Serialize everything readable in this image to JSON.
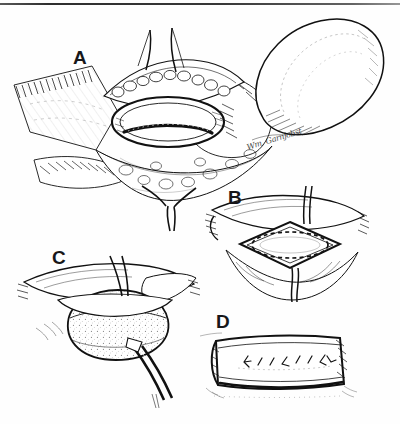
{
  "figure": {
    "medium": "pen-and-ink line drawing",
    "background_color": "#ffffff",
    "ink_color": "#111111",
    "top_rule_color": "#2a2a2a",
    "caption": "",
    "signature": "Wm. Garnjobst"
  },
  "panels": [
    {
      "id": "A",
      "label": "A",
      "title": "Exposed shaft with longitudinal opening",
      "description": "Large overview view: retracted skin flaps held open with stay sutures expose an elliptical opening in the shaft; the rounded glans lies at upper right; a suture tail hangs from the lower apex.",
      "elements": [
        "retracted-flap-left",
        "retracted-flap-right",
        "elliptical-opening",
        "dashed-incision-line",
        "glans",
        "stay-suture-top",
        "stay-suture-bottom",
        "suture-tail"
      ]
    },
    {
      "id": "B",
      "label": "B",
      "title": "Diamond-shaped defect with planned elliptical excision",
      "description": "Close-up of the opened field retracted into a diamond shape; a dashed ellipse marks the planned excision outline; vertical stay sutures run above and below.",
      "elements": [
        "diamond-defect",
        "dashed-ellipse-outline",
        "stay-suture-upper",
        "stay-suture-lower",
        "hatched-tissue-edges"
      ]
    },
    {
      "id": "C",
      "label": "C",
      "title": "Delivery of the mass with forceps",
      "description": "A stippled rounded mass is delivered through the opening; a suture passes upward from the top of the field and fine-tipped forceps grasp the mass from below right.",
      "elements": [
        "delivered-mass",
        "traction-suture",
        "forceps",
        "retracted-edges"
      ]
    },
    {
      "id": "D",
      "label": "D",
      "title": "Closed shaft with interrupted sutures",
      "description": "The cylindrical shaft is shown closed, with a horizontal row of short interrupted suture marks along the repaired line.",
      "elements": [
        "closed-cylinder",
        "suture-row",
        "shading-hatching"
      ],
      "suture_count": 8
    }
  ],
  "labels": {
    "a": "A",
    "b": "B",
    "c": "C",
    "d": "D"
  }
}
